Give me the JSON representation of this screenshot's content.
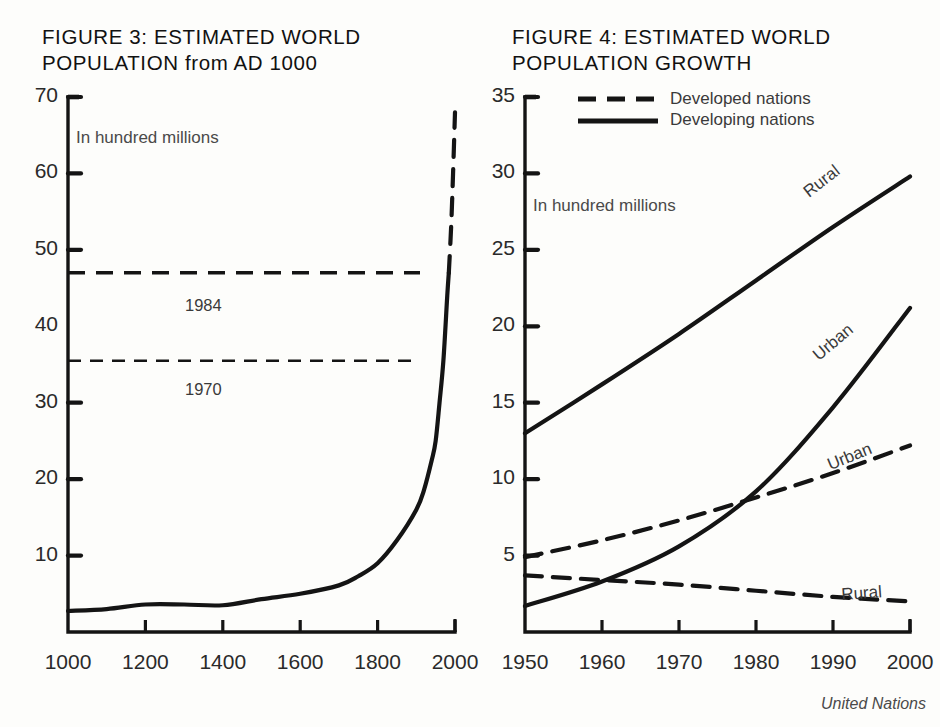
{
  "source_note": "United Nations",
  "figure3": {
    "title": "FIGURE 3: ESTIMATED WORLD\nPOPULATION from AD 1000",
    "note": "In hundred millions",
    "yticks": [
      "70",
      "60",
      "50",
      "40",
      "30",
      "20",
      "10"
    ],
    "ytick_values": [
      70,
      60,
      50,
      40,
      30,
      20,
      10
    ],
    "xticks": [
      "1000",
      "1200",
      "1400",
      "1600",
      "1800",
      "2000"
    ],
    "xtick_values": [
      1000,
      1200,
      1400,
      1600,
      1800,
      2000
    ],
    "marker_1984": "1984",
    "marker_1970": "1970"
  },
  "figure4": {
    "title": "FIGURE 4: ESTIMATED WORLD\nPOPULATION GROWTH",
    "note": "In hundred millions",
    "legend": [
      {
        "label": "Developed nations",
        "style": "dashed"
      },
      {
        "label": "Developing nations",
        "style": "solid"
      }
    ],
    "yticks": [
      "35",
      "30",
      "25",
      "20",
      "15",
      "10",
      "5"
    ],
    "ytick_values": [
      35,
      30,
      25,
      20,
      15,
      10,
      5
    ],
    "xticks": [
      "1950",
      "1960",
      "1970",
      "1980",
      "1990",
      "2000"
    ],
    "xtick_values": [
      1950,
      1960,
      1970,
      1980,
      1990,
      2000
    ],
    "curve_labels": {
      "developing_rural": "Rural",
      "developing_urban": "Urban",
      "developed_urban": "Urban",
      "developed_rural": "Rural"
    }
  },
  "chart_data": [
    {
      "type": "line",
      "title": "FIGURE 3: ESTIMATED WORLD POPULATION from AD 1000",
      "xlabel": "",
      "ylabel": "In hundred millions",
      "xlim": [
        1000,
        2000
      ],
      "ylim": [
        0,
        70
      ],
      "grid": false,
      "legend": "none",
      "annotations": [
        {
          "text": "1984",
          "type": "horizontal-reference-line",
          "y": 47
        },
        {
          "text": "1970",
          "type": "horizontal-reference-line",
          "y": 35.5
        },
        {
          "text": "In hundred millions",
          "type": "axis-note"
        }
      ],
      "series": [
        {
          "name": "World population (historical)",
          "style": "solid",
          "x": [
            1000,
            1100,
            1200,
            1300,
            1400,
            1500,
            1600,
            1700,
            1750,
            1800,
            1850,
            1900,
            1920,
            1940,
            1950,
            1960,
            1970,
            1980,
            1984
          ],
          "values": [
            2.75,
            3.0,
            3.6,
            3.6,
            3.5,
            4.3,
            5.0,
            6.1,
            7.3,
            9.0,
            12.0,
            16.0,
            18.6,
            22.5,
            25.0,
            30.0,
            35.5,
            44.0,
            47.0
          ]
        },
        {
          "name": "World population (projection)",
          "style": "dashed",
          "x": [
            1984,
            1990,
            1995,
            2000
          ],
          "values": [
            47.0,
            53.0,
            60.0,
            68.0
          ]
        }
      ]
    },
    {
      "type": "line",
      "title": "FIGURE 4: ESTIMATED WORLD POPULATION GROWTH",
      "xlabel": "",
      "ylabel": "In hundred millions",
      "xlim": [
        1950,
        2000
      ],
      "ylim": [
        0,
        35
      ],
      "grid": false,
      "legend": "top-right",
      "legend_entries": [
        "Developed nations",
        "Developing nations"
      ],
      "series": [
        {
          "name": "Developing nations - Rural",
          "style": "solid",
          "label": "Rural",
          "x": [
            1950,
            1960,
            1970,
            1980,
            1990,
            2000
          ],
          "values": [
            13.0,
            16.2,
            19.5,
            23.0,
            26.5,
            29.8
          ]
        },
        {
          "name": "Developing nations - Urban",
          "style": "solid",
          "label": "Urban",
          "x": [
            1950,
            1960,
            1970,
            1980,
            1990,
            2000
          ],
          "values": [
            1.7,
            3.3,
            5.6,
            9.2,
            14.7,
            21.2
          ]
        },
        {
          "name": "Developed nations - Urban",
          "style": "dashed",
          "label": "Urban",
          "x": [
            1950,
            1960,
            1970,
            1980,
            1990,
            2000
          ],
          "values": [
            4.9,
            6.0,
            7.3,
            8.8,
            10.4,
            12.2
          ]
        },
        {
          "name": "Developed nations - Rural",
          "style": "dashed",
          "label": "Rural",
          "x": [
            1950,
            1960,
            1970,
            1980,
            1990,
            2000
          ],
          "values": [
            3.7,
            3.4,
            3.1,
            2.7,
            2.3,
            2.0
          ]
        }
      ]
    }
  ]
}
